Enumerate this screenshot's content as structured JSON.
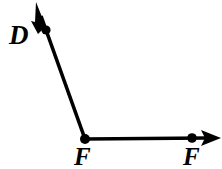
{
  "figure": {
    "background_color": "#ffffff",
    "stroke_color": "#000000",
    "width": 222,
    "height": 169,
    "labels": {
      "upper_ray_point": "D",
      "vertex": "F",
      "horizontal_ray_point": "F"
    },
    "points": [
      {
        "name": "D",
        "label": "D",
        "x": 46,
        "y": 30,
        "dot": true
      },
      {
        "name": "F-vertex",
        "label": "F",
        "x": 85,
        "y": 139,
        "dot": true
      },
      {
        "name": "F-end",
        "label": "F",
        "x": 192,
        "y": 138,
        "dot": true
      }
    ],
    "rays": [
      {
        "name": "ray-upper-left",
        "from": {
          "x": 85,
          "y": 139
        },
        "through": {
          "x": 46,
          "y": 30
        },
        "arrow_tip": {
          "x": 36,
          "y": 2
        },
        "arrow": true
      },
      {
        "name": "ray-horizontal-right",
        "from": {
          "x": 85,
          "y": 139
        },
        "through": {
          "x": 192,
          "y": 138
        },
        "arrow_tip": {
          "x": 220,
          "y": 138
        },
        "arrow": true
      }
    ]
  }
}
